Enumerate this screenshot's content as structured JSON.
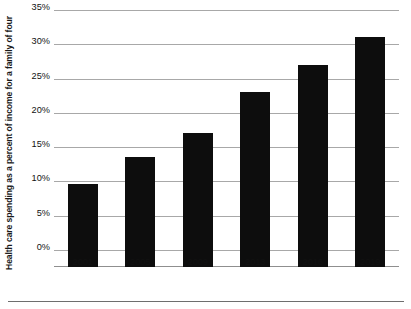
{
  "chart_data": {
    "type": "bar",
    "title": "",
    "subtitle": "",
    "xlabel": "",
    "ylabel": "Health care spending as a percent of income for a family of four",
    "categories": [
      "2001",
      "2005",
      "2009",
      "2013",
      "2016",
      "2019"
    ],
    "values": [
      9.7,
      13.6,
      17.1,
      23.0,
      27.0,
      31.0
    ],
    "series": [
      {
        "name": "Health care spending share of income",
        "values": [
          9.7,
          13.6,
          17.1,
          23.0,
          27.0,
          31.0
        ]
      }
    ],
    "ylim": [
      0,
      35
    ],
    "ytick_values": [
      0,
      5,
      10,
      15,
      20,
      25,
      30,
      35
    ],
    "ytick_labels": [
      "0%",
      "5%",
      "10%",
      "15%",
      "20%",
      "25%",
      "30%",
      "35%"
    ],
    "grid": true,
    "grid_axis": "y",
    "legend": false,
    "legend_position": "none",
    "bar_color": "#0d0d0d",
    "gridline_color": "#a8a8a8",
    "background_color": "#ffffff",
    "text_color": "#111111",
    "annotations": []
  }
}
